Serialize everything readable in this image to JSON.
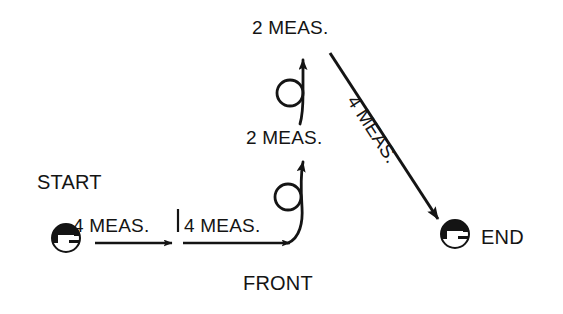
{
  "diagram": {
    "background_color": "#ffffff",
    "ink_color": "#141414",
    "labels": {
      "start": "START",
      "end": "END",
      "front": "FRONT",
      "segment_1": "4 MEAS.",
      "segment_2": "4 MEAS.",
      "segment_3": "2 MEAS.",
      "segment_4": "2 MEAS.",
      "segment_5": "4 MEAS."
    },
    "markers": [
      {
        "name": "start-dancer",
        "label": "START",
        "x": 66,
        "y": 238
      },
      {
        "name": "end-dancer",
        "label": "END",
        "x": 455,
        "y": 234
      }
    ],
    "turns": [
      {
        "name": "lower-turn",
        "cx": 288,
        "cy": 197,
        "r": 13
      },
      {
        "name": "upper-turn",
        "cx": 290,
        "cy": 93,
        "r": 13
      }
    ],
    "paths": [
      {
        "name": "path-segment-1",
        "kind": "straight-arrow",
        "measures": "4 MEAS.",
        "from": [
          95,
          243
        ],
        "to": [
          172,
          243
        ]
      },
      {
        "name": "path-segment-2",
        "kind": "straight-arrow",
        "measures": "4 MEAS.",
        "from": [
          183,
          243
        ],
        "to": [
          290,
          243
        ]
      },
      {
        "name": "path-segment-3",
        "kind": "turn-arrow-up",
        "measures": "2 MEAS.",
        "from": [
          290,
          243
        ],
        "to": [
          303,
          155
        ]
      },
      {
        "name": "path-segment-4",
        "kind": "turn-arrow-up",
        "measures": "2 MEAS.",
        "from": [
          303,
          120
        ],
        "to": [
          303,
          52
        ]
      },
      {
        "name": "path-segment-5",
        "kind": "diagonal-arrow",
        "measures": "4 MEAS.",
        "from": [
          330,
          53
        ],
        "to": [
          441,
          223
        ]
      }
    ],
    "divider": {
      "name": "segment-divider-tick",
      "x": 178,
      "y_top": 208,
      "y_bottom": 232
    }
  }
}
